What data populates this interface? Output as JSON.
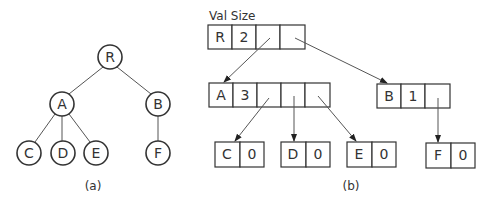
{
  "tree": {
    "caption": "(a)",
    "nodes": {
      "R": "R",
      "A": "A",
      "B": "B",
      "C": "C",
      "D": "D",
      "E": "E",
      "F": "F"
    },
    "edges": [
      [
        "R",
        "A"
      ],
      [
        "R",
        "B"
      ],
      [
        "A",
        "C"
      ],
      [
        "A",
        "D"
      ],
      [
        "A",
        "E"
      ],
      [
        "B",
        "F"
      ]
    ]
  },
  "structure": {
    "caption": "(b)",
    "header": "Val Size",
    "records": {
      "R": {
        "val": "R",
        "size": "2",
        "pointers": 2
      },
      "A": {
        "val": "A",
        "size": "3",
        "pointers": 3
      },
      "B": {
        "val": "B",
        "size": "1",
        "pointers": 1
      },
      "C": {
        "val": "C",
        "size": "0",
        "pointers": 0
      },
      "D": {
        "val": "D",
        "size": "0",
        "pointers": 0
      },
      "E": {
        "val": "E",
        "size": "0",
        "pointers": 0
      },
      "F": {
        "val": "F",
        "size": "0",
        "pointers": 0
      }
    }
  },
  "colors": {
    "stroke": "#333333",
    "background": "#ffffff"
  }
}
